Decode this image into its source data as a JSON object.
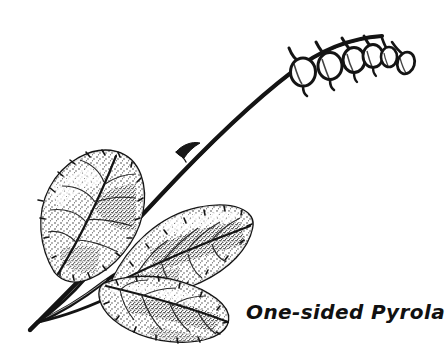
{
  "illustration": {
    "title": "One-sided Pyrola",
    "subject": "One-sided Pyrola botanical line drawing",
    "medium": "pen-and-ink stipple drawing",
    "background_color": "#ffffff",
    "ink_color": "#111111",
    "canvas": {
      "width": 435,
      "height": 357
    }
  },
  "label": {
    "text": "One-sided Pyrola",
    "color": "#111111",
    "x": 246,
    "y": 300,
    "font_size_px": 20,
    "style": "bold italic handwritten"
  },
  "plant": {
    "common_name": "One-sided Pyrola",
    "stem": {
      "name": "arching flower stalk",
      "description": "long curved scape rising from lower left to upper right then arching over to the right",
      "start": [
        28,
        330
      ],
      "end": [
        405,
        42
      ]
    },
    "bract": {
      "name": "stem bract",
      "description": "small pointed scale leaf on the mid stem",
      "position": [
        186,
        146
      ]
    },
    "flowers": {
      "count": 6,
      "arrangement": "one-sided nodding raceme",
      "description": "rounded bell-shaped flowers hanging downward from one side of the arching stalk",
      "items": [
        {
          "name": "flower-1",
          "cx": 303,
          "cy": 70,
          "rx": 12,
          "ry": 14,
          "stalk_from": [
            291,
            47
          ],
          "style_tip": [
            304,
            88
          ]
        },
        {
          "name": "flower-2",
          "cx": 330,
          "cy": 64,
          "rx": 12,
          "ry": 14,
          "stalk_from": [
            318,
            42
          ],
          "style_tip": [
            330,
            82
          ]
        },
        {
          "name": "flower-3",
          "cx": 353,
          "cy": 58,
          "rx": 11,
          "ry": 13,
          "stalk_from": [
            344,
            38
          ],
          "style_tip": [
            353,
            74
          ]
        },
        {
          "name": "flower-4",
          "cx": 372,
          "cy": 55,
          "rx": 10,
          "ry": 12,
          "stalk_from": [
            365,
            36
          ],
          "style_tip": [
            372,
            69
          ]
        },
        {
          "name": "flower-5",
          "cx": 388,
          "cy": 54,
          "rx": 8,
          "ry": 10,
          "stalk_from": [
            383,
            38
          ],
          "style_tip": [
            388,
            66
          ]
        },
        {
          "name": "flower-bud",
          "cx": 404,
          "cy": 60,
          "rx": 8,
          "ry": 11,
          "stalk_from": [
            397,
            43
          ],
          "style_tip": [
            404,
            72
          ]
        }
      ]
    },
    "leaves": {
      "count": 3,
      "description": "basal rosette of broad oval leaves with finely toothed margins and stippled shading",
      "items": [
        {
          "name": "leaf-upper-left",
          "center": [
            84,
            215
          ],
          "length": 110,
          "width": 78,
          "tip": [
            120,
            158
          ],
          "base": [
            55,
            272
          ],
          "rotation_deg": -32
        },
        {
          "name": "leaf-middle-right",
          "center": [
            185,
            248
          ],
          "length": 120,
          "width": 74,
          "tip": [
            250,
            210
          ],
          "base": [
            110,
            280
          ],
          "rotation_deg": 12
        },
        {
          "name": "leaf-lower",
          "center": [
            168,
            288
          ],
          "length": 115,
          "width": 70,
          "tip": [
            228,
            296
          ],
          "base": [
            100,
            284
          ],
          "rotation_deg": 22
        }
      ]
    },
    "petioles": {
      "name": "leaf stalks",
      "description": "three slender leaf stalks converging at the base near the lower left",
      "convergence_point": [
        38,
        322
      ]
    }
  }
}
